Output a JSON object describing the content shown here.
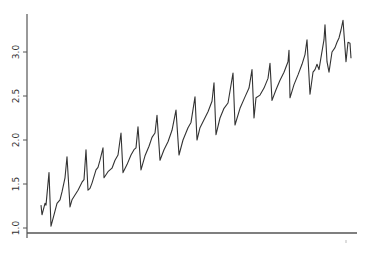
{
  "chart_data": {
    "type": "line",
    "title": "",
    "xlabel": "",
    "ylabel": "",
    "ylim": [
      1.0,
      3.4
    ],
    "yticks": [
      "1.0",
      "1.5",
      "2.0",
      "2.5",
      "3.0"
    ],
    "ytick_values": [
      1.0,
      1.5,
      2.0,
      2.5,
      3.0
    ],
    "xticks": [],
    "grid": false,
    "legend": null,
    "line_color": "#333333",
    "series": [
      {
        "name": "series",
        "x": [
          41,
          42,
          45,
          46,
          49,
          51,
          54,
          57,
          60,
          62,
          65,
          67,
          70,
          72,
          78,
          82,
          84,
          86,
          88,
          90,
          92,
          96,
          98,
          100,
          103,
          104,
          108,
          112,
          115,
          118,
          121,
          123,
          127,
          131,
          134,
          136,
          138,
          141,
          145,
          149,
          152,
          155,
          157,
          160,
          164,
          168,
          172,
          176,
          179,
          183,
          188,
          191,
          195,
          197,
          200,
          204,
          208,
          212,
          214,
          216,
          220,
          224,
          228,
          233,
          235,
          240,
          245,
          249,
          252,
          254,
          256,
          260,
          264,
          268,
          270,
          272,
          276,
          280,
          284,
          288,
          289,
          290,
          294,
          298,
          302,
          305,
          307,
          310,
          313,
          315,
          317,
          319,
          321,
          324,
          325,
          327,
          329,
          332,
          335,
          337,
          339,
          341,
          343,
          346,
          348,
          350,
          351
        ],
        "values": [
          1.26,
          1.15,
          1.28,
          1.26,
          1.63,
          1.02,
          1.15,
          1.28,
          1.32,
          1.41,
          1.57,
          1.81,
          1.24,
          1.32,
          1.43,
          1.52,
          1.55,
          1.89,
          1.43,
          1.45,
          1.51,
          1.66,
          1.69,
          1.77,
          1.91,
          1.57,
          1.64,
          1.68,
          1.77,
          1.83,
          2.08,
          1.63,
          1.72,
          1.83,
          1.89,
          1.91,
          2.15,
          1.66,
          1.82,
          1.93,
          2.03,
          2.08,
          2.28,
          1.77,
          1.89,
          1.98,
          2.11,
          2.34,
          1.83,
          2.0,
          2.14,
          2.2,
          2.49,
          2.0,
          2.14,
          2.23,
          2.32,
          2.44,
          2.65,
          2.06,
          2.25,
          2.36,
          2.42,
          2.76,
          2.17,
          2.36,
          2.49,
          2.59,
          2.8,
          2.25,
          2.48,
          2.51,
          2.59,
          2.7,
          2.87,
          2.45,
          2.57,
          2.68,
          2.77,
          2.89,
          3.02,
          2.48,
          2.63,
          2.74,
          2.86,
          2.97,
          3.14,
          2.52,
          2.77,
          2.8,
          2.86,
          2.8,
          2.94,
          3.14,
          3.31,
          2.89,
          2.77,
          3.0,
          3.05,
          3.11,
          3.16,
          3.25,
          3.36,
          2.89,
          3.11,
          3.1,
          2.93
        ]
      }
    ]
  },
  "axes": {
    "y_tick_labels": [
      "1.0",
      "1.5",
      "2.0",
      "2.5",
      "3.0"
    ]
  }
}
